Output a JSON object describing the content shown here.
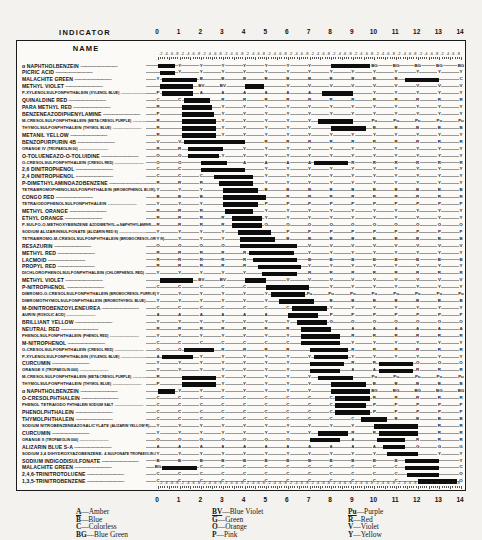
{
  "header": {
    "indicator_label": "INDICATOR",
    "name_label": "NAME"
  },
  "axis": {
    "ticks": [
      "0",
      "1",
      "2",
      "3",
      "4",
      "5",
      "6",
      "7",
      "8",
      "9",
      "10",
      "11",
      "12",
      "13",
      "14"
    ],
    "minor_labels": ".2 .4 .6 .8",
    "min": 0,
    "max": 14
  },
  "legend": {
    "columns": [
      [
        {
          "key": "A",
          "name": "Amber"
        },
        {
          "key": "B",
          "name": "Blue"
        },
        {
          "key": "C",
          "name": "Colorless"
        },
        {
          "key": "BG",
          "name": "Blue Green"
        }
      ],
      [
        {
          "key": "BV",
          "name": "Blue Violet"
        },
        {
          "key": "G",
          "name": "Green"
        },
        {
          "key": "O",
          "name": "Orange"
        },
        {
          "key": "P",
          "name": "Pink"
        }
      ],
      [
        {
          "key": "Pu",
          "name": "Purple"
        },
        {
          "key": "R",
          "name": "Red"
        },
        {
          "key": "V",
          "name": "Violet"
        },
        {
          "key": "Y",
          "name": "Yellow"
        }
      ]
    ]
  },
  "chart_data": {
    "type": "table",
    "xlabel": "pH",
    "xlim": [
      0,
      14
    ],
    "grid": false,
    "legend_position": "bottom",
    "color_codes": {
      "A": "Amber",
      "B": "Blue",
      "C": "Colorless",
      "BG": "Blue Green",
      "BV": "Blue Violet",
      "G": "Green",
      "O": "Orange",
      "P": "Pink",
      "Pu": "Purple",
      "R": "Red",
      "V": "Violet",
      "Y": "Yellow"
    },
    "rows": [
      {
        "name": "&alpha; NAPHTHOLBENZEIN",
        "sub": "",
        "acid": "G",
        "base": "Y",
        "bars": [
          [
            0.0,
            0.8
          ],
          [
            8.0,
            9.8
          ]
        ],
        "mid": "Y",
        "alk": "BG"
      },
      {
        "name": "PICRIC ACID",
        "sub": "",
        "acid": "C",
        "base": "Y",
        "bars": [
          [
            0.1,
            0.8
          ]
        ],
        "mid": "Y",
        "alk": "Y"
      },
      {
        "name": "MALACHITE GREEN",
        "sub": "",
        "acid": "Y",
        "base": "BG",
        "bars": [
          [
            0.2,
            1.8
          ],
          [
            11.4,
            13.0
          ]
        ],
        "mid": "B",
        "alk": "C"
      },
      {
        "name": "METHYL VIOLET",
        "sub": "",
        "acid": "Y",
        "base": "BV",
        "bars": [
          [
            0.1,
            1.6
          ],
          [
            4.0,
            4.9
          ]
        ],
        "mid": "BV",
        "alk": "V"
      },
      {
        "name": "P-XYLENOLSULFONPHTHALEIN",
        "sub": "(XYLENOL BLUE)",
        "acid": "P",
        "base": "A",
        "bars": [
          [
            0.2,
            1.6
          ],
          [
            7.6,
            9.0
          ]
        ],
        "mid": "A",
        "alk": "Y"
      },
      {
        "name": "QUINALDINE RED",
        "sub": "",
        "acid": "C",
        "base": "R",
        "bars": [
          [
            1.2,
            2.4
          ]
        ],
        "mid": "R",
        "alk": "R"
      },
      {
        "name": "PARA METHYL RED",
        "sub": "",
        "acid": "R",
        "base": "Y",
        "bars": [
          [
            1.1,
            2.5
          ]
        ],
        "mid": "Y",
        "alk": "Y"
      },
      {
        "name": "BENZENEAZODIPHENYLAMINE",
        "sub": "",
        "acid": "P",
        "base": "Y",
        "bars": [
          [
            1.1,
            2.6
          ]
        ],
        "mid": "Y",
        "alk": "Y"
      },
      {
        "name": "M-CRESOLSULFONPHTHALEIN",
        "sub": "(META CRESOL PURPLE)",
        "acid": "R",
        "base": "Y",
        "bars": [
          [
            1.1,
            2.7
          ],
          [
            7.4,
            9.0
          ]
        ],
        "mid": "Y",
        "alk": "Pu"
      },
      {
        "name": "THYMOLSULFONPHTHALEIN",
        "sub": "(THYMOL BLUE)",
        "acid": "R",
        "base": "Y",
        "bars": [
          [
            1.1,
            2.7
          ],
          [
            8.0,
            9.6
          ]
        ],
        "mid": "Y",
        "alk": "B"
      },
      {
        "name": "METANIL YELLOW",
        "sub": "",
        "acid": "R",
        "base": "Y",
        "bars": [
          [
            1.1,
            2.7
          ]
        ],
        "mid": "Y",
        "alk": "Y"
      },
      {
        "name": "BENZOPURPURIN 4B",
        "sub": "",
        "acid": "V",
        "base": "R",
        "bars": [
          [
            1.2,
            4.0
          ]
        ],
        "mid": "R",
        "alk": "R"
      },
      {
        "name": "ORANGE IV",
        "sub": "(TROPAEOLIN 00)",
        "acid": "R",
        "base": "Y",
        "bars": [
          [
            1.4,
            3.0
          ]
        ],
        "mid": "Y",
        "alk": "Y"
      },
      {
        "name": "O-TOLUENEAZO-O-TOLUIDINE",
        "sub": "",
        "acid": "O",
        "base": "Y",
        "bars": [
          [
            1.4,
            2.8
          ]
        ],
        "mid": "Y",
        "alk": "Y"
      },
      {
        "name": "O-CRESOLSULFONPHTHALEIN",
        "sub": "(CRESOL RED)",
        "acid": "O",
        "base": "A",
        "bars": [
          [
            2.0,
            3.2
          ],
          [
            7.2,
            8.8
          ]
        ],
        "mid": "A",
        "alk": "R"
      },
      {
        "name": "2,6 DINITROPHENOL",
        "sub": "",
        "acid": "C",
        "base": "Y",
        "bars": [
          [
            2.0,
            4.0
          ]
        ],
        "mid": "Y",
        "alk": "Y"
      },
      {
        "name": "2,4 DINITROPHENOL",
        "sub": "",
        "acid": "C",
        "base": "Y",
        "bars": [
          [
            2.6,
            4.4
          ]
        ],
        "mid": "Y",
        "alk": "Y"
      },
      {
        "name": "P-DIMETHYLAMINOAZOBENZENE",
        "sub": "",
        "acid": "R",
        "base": "Y",
        "bars": [
          [
            2.8,
            4.4
          ]
        ],
        "mid": "Y",
        "alk": "Y"
      },
      {
        "name": "TETRABROMOPHENOLSULFONPHTHALEIN",
        "sub": "(BROMOPHENOL BLUE)",
        "acid": "Y",
        "base": "B",
        "bars": [
          [
            3.0,
            4.6
          ]
        ],
        "mid": "B",
        "alk": "B"
      },
      {
        "name": "CONGO RED",
        "sub": "",
        "acid": "B",
        "base": "R",
        "bars": [
          [
            3.0,
            5.0
          ]
        ],
        "mid": "R",
        "alk": "R"
      },
      {
        "name": "TETRAIODOPHENOLSULFONPHTHALEIN",
        "sub": "",
        "acid": "Y",
        "base": "P",
        "bars": [
          [
            3.0,
            4.6
          ]
        ],
        "mid": "P",
        "alk": "P"
      },
      {
        "name": "METHYL ORANGE",
        "sub": "",
        "acid": "R",
        "base": "Y",
        "bars": [
          [
            3.1,
            4.4
          ]
        ],
        "mid": "Y",
        "alk": "Y"
      },
      {
        "name": "ETHYL ORANGE",
        "sub": "",
        "acid": "R",
        "base": "Y",
        "bars": [
          [
            3.4,
            4.8
          ]
        ],
        "mid": "Y",
        "alk": "Y"
      },
      {
        "name": "P-SULFO-O-METHOXYBENZENE",
        "sub": "AZODIMETHYL-&alpha;-NAPHTHYLAMINE",
        "acid": "R",
        "base": "O",
        "bars": [
          [
            3.4,
            4.8
          ]
        ],
        "mid": "O",
        "alk": "O"
      },
      {
        "name": "SODIUM ALIZARINSULFONATE",
        "sub": "(ALIZARIN RED S)",
        "acid": "Y",
        "base": "P",
        "bars": [
          [
            3.7,
            5.2
          ]
        ],
        "mid": "P",
        "alk": "P"
      },
      {
        "name": "TETRABROMO-M-CRESOLSULFONPHTHALEIN",
        "sub": "(BROMOCRESOL GREEN)",
        "acid": "Y",
        "base": "B",
        "bars": [
          [
            3.8,
            5.4
          ]
        ],
        "mid": "B",
        "alk": "B"
      },
      {
        "name": "RESAZURIN",
        "sub": "",
        "acid": "O",
        "base": "V",
        "bars": [
          [
            3.8,
            6.4
          ]
        ],
        "mid": "V",
        "alk": "V"
      },
      {
        "name": "METHYL RED",
        "sub": "",
        "acid": "R",
        "base": "Y",
        "bars": [
          [
            4.2,
            6.3
          ]
        ],
        "mid": "Y",
        "alk": "Y"
      },
      {
        "name": "LACMOID",
        "sub": "",
        "acid": "R",
        "base": "B",
        "bars": [
          [
            4.4,
            6.4
          ]
        ],
        "mid": "B",
        "alk": "B"
      },
      {
        "name": "PROPYL RED",
        "sub": "",
        "acid": "R",
        "base": "Y",
        "bars": [
          [
            4.6,
            6.6
          ]
        ],
        "mid": "Y",
        "alk": "Y"
      },
      {
        "name": "DICHLOROPHENOLSULFONPHTHALEIN",
        "sub": "(CHLORPHENOL RED)",
        "acid": "Y",
        "base": "R",
        "bars": [
          [
            4.8,
            6.4
          ]
        ],
        "mid": "R",
        "alk": "R"
      },
      {
        "name": "METHYL VIOLET",
        "sub": "",
        "acid": "V",
        "base": "V",
        "bars": [
          [
            0.1,
            1.6
          ],
          [
            4.0,
            5.0
          ]
        ],
        "mid": "BV",
        "alk": "V"
      },
      {
        "name": "P-NITROPHENOL",
        "sub": "",
        "acid": "C",
        "base": "Y",
        "bars": [
          [
            5.0,
            7.0
          ]
        ],
        "mid": "Y",
        "alk": "Y"
      },
      {
        "name": "DIBROMO-O-CRESOLSULFONPHTHALEIN",
        "sub": "(BROMOCRESOL PURPLE)",
        "acid": "Y",
        "base": "Pu",
        "bars": [
          [
            5.2,
            6.8
          ]
        ],
        "mid": "Pu",
        "alk": "Pu"
      },
      {
        "name": "DIBROMOTHYMOLSULFONPHTHALEIN",
        "sub": "(BROMOTHYMOL BLUE)",
        "acid": "Y",
        "base": "B",
        "bars": [
          [
            5.6,
            7.2
          ]
        ],
        "mid": "B",
        "alk": "B"
      },
      {
        "name": "M-DINITROBENZOYLENEUREA",
        "sub": "",
        "acid": "C",
        "base": "Y",
        "bars": [
          [
            6.2,
            7.8
          ]
        ],
        "mid": "Y",
        "alk": "Y"
      },
      {
        "name": "AURIN",
        "sub": "(ROSOLIC ACID)",
        "acid": "A",
        "base": "P",
        "bars": [
          [
            6.0,
            7.4
          ]
        ],
        "mid": "P",
        "alk": "R"
      },
      {
        "name": "BRILLIANT YELLOW",
        "sub": "",
        "acid": "Y",
        "base": "O",
        "bars": [
          [
            6.4,
            7.8
          ]
        ],
        "mid": "O",
        "alk": "O"
      },
      {
        "name": "NEUTRAL RED",
        "sub": "",
        "acid": "R",
        "base": "A",
        "bars": [
          [
            6.6,
            8.0
          ]
        ],
        "mid": "A",
        "alk": "A"
      },
      {
        "name": "PHENOLSULFONPHTHALEIN",
        "sub": "(PHENOL RED)",
        "acid": "Y",
        "base": "R",
        "bars": [
          [
            6.6,
            8.4
          ]
        ],
        "mid": "R",
        "alk": "R"
      },
      {
        "name": "M-NITROPHENOL",
        "sub": "",
        "acid": "C",
        "base": "Y",
        "bars": [
          [
            6.6,
            8.4
          ]
        ],
        "mid": "Y",
        "alk": "Y"
      },
      {
        "name": "O-CRESOLSULFONPHTHALEIN",
        "sub": "(CRESOL RED)",
        "acid": "O",
        "base": "R",
        "bars": [
          [
            1.2,
            2.6
          ],
          [
            7.0,
            8.8
          ]
        ],
        "mid": "R",
        "alk": "R"
      },
      {
        "name": "P-XYLENOLSULFONPHTHALEIN",
        "sub": "(XYLENOL BLUE)",
        "acid": "A",
        "base": "Y",
        "bars": [
          [
            0.2,
            1.6
          ],
          [
            7.2,
            8.8
          ]
        ],
        "mid": "Y",
        "alk": "Y"
      },
      {
        "name": "CURCUMIN",
        "sub": "",
        "acid": "Y",
        "base": "R",
        "bars": [
          [
            7.0,
            8.6
          ],
          [
            10.2,
            11.8
          ]
        ],
        "mid": "R",
        "alk": "O"
      },
      {
        "name": "ORANGE II",
        "sub": "(TROPAEOLIN 000)",
        "acid": "Y",
        "base": "A",
        "bars": [
          [
            7.0,
            8.4
          ],
          [
            10.2,
            11.8
          ]
        ],
        "mid": "A",
        "alk": "R"
      },
      {
        "name": "M-CRESOLSULFONPHTHALEIN",
        "sub": "(META CRESOL PURPLE)",
        "acid": "R",
        "base": "Y",
        "bars": [
          [
            1.1,
            2.7
          ],
          [
            7.4,
            9.0
          ]
        ],
        "mid": "Y",
        "alk": "Pu"
      },
      {
        "name": "THYMOLSULFONPHTHALEIN",
        "sub": "(THYMOL BLUE)",
        "acid": "P",
        "base": "Y",
        "bars": [
          [
            1.1,
            2.7
          ],
          [
            8.0,
            9.6
          ]
        ],
        "mid": "Y",
        "alk": "B"
      },
      {
        "name": "&alpha; NAPHTHOLBENZEIN",
        "sub": "",
        "acid": "C",
        "base": "Y",
        "bars": [
          [
            0.0,
            0.8
          ],
          [
            8.0,
            9.8
          ]
        ],
        "mid": "Y",
        "alk": "BG"
      },
      {
        "name": "O-CRESOLPHTHALEIN",
        "sub": "",
        "acid": "C",
        "base": "R",
        "bars": [
          [
            8.2,
            9.8
          ]
        ],
        "mid": "R",
        "alk": "R"
      },
      {
        "name": "PHENOL TETRAIODO",
        "sub": "PHTHALEIN SODIUM SALT",
        "acid": "C",
        "base": "P",
        "bars": [
          [
            8.2,
            9.6
          ]
        ],
        "mid": "P",
        "alk": "P"
      },
      {
        "name": "PHENOLPHTHALEIN",
        "sub": "",
        "acid": "C",
        "base": "P",
        "bars": [
          [
            8.2,
            9.8
          ]
        ],
        "mid": "P",
        "alk": "P"
      },
      {
        "name": "THYMOLPHTHALEIN",
        "sub": "",
        "acid": "C",
        "base": "B",
        "bars": [
          [
            9.4,
            10.6
          ]
        ],
        "mid": "B",
        "alk": "B"
      },
      {
        "name": "SODIUM NITROBENZENEAZOSALICYLATE",
        "sub": "(ALIZARIN YELLOW R)",
        "acid": "Y",
        "base": "R",
        "bars": [
          [
            10.0,
            12.0
          ]
        ],
        "mid": "R",
        "alk": "R"
      },
      {
        "name": "CURCUMIN",
        "sub": "",
        "acid": "Y",
        "base": "R",
        "bars": [
          [
            7.4,
            8.8
          ],
          [
            10.2,
            12.0
          ]
        ],
        "mid": "R",
        "alk": "R"
      },
      {
        "name": "ORANGE II",
        "sub": "(TROPAEOLIN 000)",
        "acid": "O",
        "base": "A",
        "bars": [
          [
            7.0,
            8.4
          ],
          [
            10.1,
            11.4
          ]
        ],
        "mid": "A",
        "alk": "R"
      },
      {
        "name": "ALIZARIN BLUE S-A",
        "sub": "",
        "acid": "A",
        "base": "G",
        "bars": [
          [
            10.4,
            11.4
          ]
        ],
        "mid": "G",
        "alk": "BG"
      },
      {
        "name": "SODIUM 2,4 DIHYDROXYAZOBENZENE-",
        "sub": "4-SULFONATE TROPAEOLIN O",
        "acid": "Y",
        "base": "Y",
        "bars": [
          [
            10.6,
            12.0
          ]
        ],
        "mid": "O",
        "alk": "O"
      },
      {
        "name": "SODIUM INDIGODISULFONATE",
        "sub": "",
        "acid": "B",
        "base": "Y",
        "bars": [
          [
            11.4,
            13.0
          ]
        ],
        "mid": "Y",
        "alk": "Y"
      },
      {
        "name": "MALACHITE GREEN",
        "sub": "",
        "acid": "BG",
        "base": "C",
        "bars": [
          [
            0.2,
            1.8
          ],
          [
            11.4,
            13.0
          ]
        ],
        "mid": "C",
        "alk": "C"
      },
      {
        "name": "2,4,6-TRINITROTOLUENE",
        "sub": "",
        "acid": "C",
        "base": "O",
        "bars": [
          [
            11.5,
            13.0
          ]
        ],
        "mid": "O",
        "alk": "O"
      },
      {
        "name": "1,3,5-TRINITROBENZENE",
        "sub": "",
        "acid": "C",
        "base": "O",
        "bars": [
          [
            12.0,
            13.8
          ]
        ],
        "mid": "O",
        "alk": "O"
      }
    ]
  }
}
